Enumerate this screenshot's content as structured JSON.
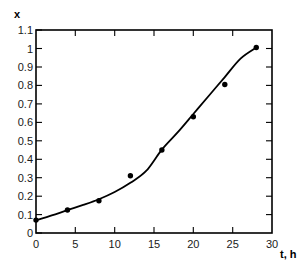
{
  "chart_data": {
    "type": "scatter",
    "title": "",
    "subtitle": "",
    "xlabel": "t, h",
    "ylabel": "x",
    "xlim": [
      0,
      30
    ],
    "ylim": [
      0,
      1.1
    ],
    "xticks": [
      0,
      5,
      10,
      15,
      20,
      25,
      30
    ],
    "xtick_labels": [
      "0",
      "5",
      "10",
      "15",
      "20",
      "25",
      "30"
    ],
    "yticks": [
      0,
      0.1,
      0.2,
      0.3,
      0.4,
      0.5,
      0.6,
      0.7,
      0.8,
      0.9,
      1.0,
      1.1
    ],
    "ytick_labels": [
      "0",
      "0.1",
      "0.2",
      "0.3",
      "0.4",
      "0.5",
      "0.6",
      "0.7",
      "0.8",
      "0.9",
      "1",
      "1.1"
    ],
    "grid": false,
    "legend": null,
    "annotations": [],
    "series": [
      {
        "name": "measured points",
        "style": "markers",
        "marker": "filled-circle",
        "color": "#000000",
        "x": [
          0,
          4,
          8,
          12,
          16,
          20,
          24,
          28
        ],
        "values": [
          0.07,
          0.125,
          0.175,
          0.31,
          0.45,
          0.63,
          0.805,
          1.005
        ]
      },
      {
        "name": "fitted curve",
        "style": "line",
        "color": "#000000",
        "x": [
          0,
          2,
          4,
          6,
          8,
          10,
          12,
          14,
          16,
          18,
          20,
          22,
          24,
          26,
          28
        ],
        "values": [
          0.068,
          0.095,
          0.124,
          0.152,
          0.183,
          0.222,
          0.272,
          0.336,
          0.452,
          0.545,
          0.645,
          0.745,
          0.845,
          0.945,
          1.005
        ]
      }
    ]
  },
  "axes": {
    "y_axis_title": "x",
    "x_axis_title": "t, h"
  }
}
